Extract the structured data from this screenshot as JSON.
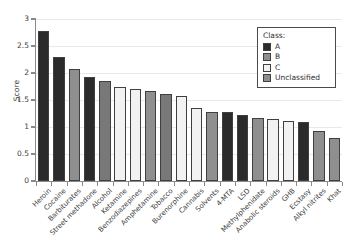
{
  "chart_data": {
    "type": "bar",
    "title": "",
    "xlabel": "",
    "ylabel": "Score",
    "ylim": [
      0,
      3
    ],
    "ytick_labels": [
      "0",
      "0.5",
      "1",
      "1.5",
      "2",
      "2.5",
      "3"
    ],
    "ytick_values": [
      0,
      0.5,
      1,
      1.5,
      2,
      2.5,
      3
    ],
    "grid": true,
    "legend_position": "top-right",
    "legend_title": "Class:",
    "categories": [
      "Heroin",
      "Cocaine",
      "Barbiturates",
      "Street methadone",
      "Alcohol",
      "Ketamine",
      "Benzodiazepines",
      "Amphetamine",
      "Tobacco",
      "Burenorphine",
      "Cannabis",
      "Solvents",
      "4-MTA",
      "LSD",
      "Methylphenidate",
      "Anabolic steroids",
      "GHB",
      "Ecstasy",
      "Alkyl nitrites",
      "Khat"
    ],
    "values": [
      2.78,
      2.3,
      2.08,
      1.93,
      1.85,
      1.75,
      1.7,
      1.67,
      1.62,
      1.57,
      1.35,
      1.27,
      1.27,
      1.22,
      1.17,
      1.14,
      1.12,
      1.09,
      0.92,
      0.8
    ],
    "classes": [
      "A",
      "A",
      "B",
      "A",
      "Unclassified",
      "C",
      "C",
      "B",
      "Unclassified",
      "C",
      "C",
      "B",
      "A",
      "A",
      "B",
      "C",
      "C",
      "A",
      "B",
      "B"
    ],
    "legend_entries": [
      {
        "label": "A",
        "color": "#2b2b2b"
      },
      {
        "label": "B",
        "color": "#8f8f8f"
      },
      {
        "label": "C",
        "color": "#f2f2f2"
      },
      {
        "label": "Unclassified",
        "color": "#8f8f8f"
      }
    ],
    "class_colors": {
      "A": "#2b2b2b",
      "B": "#8f8f8f",
      "C": "#f2f2f2",
      "Unclassified": "#787878"
    }
  }
}
